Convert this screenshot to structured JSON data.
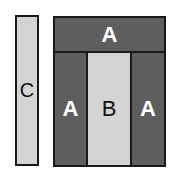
{
  "diagram": {
    "blocks": [
      {
        "id": "c",
        "label": "C",
        "shade": "light"
      },
      {
        "id": "top-a",
        "label": "A",
        "shade": "dark"
      },
      {
        "id": "left-a",
        "label": "A",
        "shade": "dark"
      },
      {
        "id": "b",
        "label": "B",
        "shade": "light"
      },
      {
        "id": "right-a",
        "label": "A",
        "shade": "dark"
      }
    ],
    "colors": {
      "dark": "#5e5e5e",
      "light": "#d4d4d4",
      "border": "#1a1a1a"
    }
  }
}
